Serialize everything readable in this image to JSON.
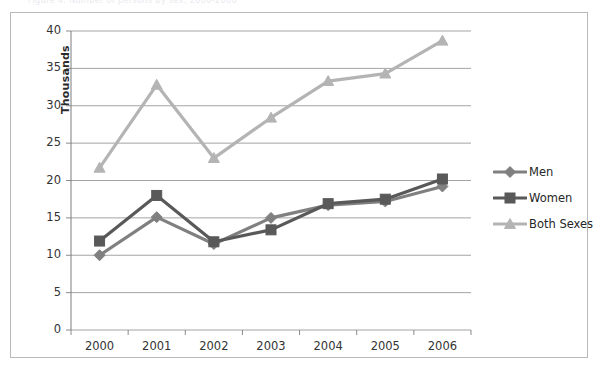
{
  "top_caption_remnant": "Figure 4. Number of persons by sex, 2000-2006",
  "chart_frame": {
    "border_color": "#b9b9b9",
    "background": "#ffffff"
  },
  "axis": {
    "y_title": "Thousands",
    "y_ticks": [
      "40",
      "35",
      "30",
      "25",
      "20",
      "15",
      "10",
      "5",
      "0"
    ],
    "x_ticks": [
      "2000",
      "2001",
      "2002",
      "2003",
      "2004",
      "2005",
      "2006"
    ]
  },
  "legend": {
    "position": "right",
    "entries": [
      {
        "label": "Men",
        "color": "#808080",
        "marker": "diamond"
      },
      {
        "label": "Women",
        "color": "#595959",
        "marker": "square"
      },
      {
        "label": "Both Sexes",
        "color": "#b4b4b4",
        "marker": "triangle"
      }
    ]
  },
  "chart_data": {
    "type": "line",
    "title": "",
    "subtitle": "",
    "xlabel": "",
    "ylabel": "Thousands",
    "categories": [
      "2000",
      "2001",
      "2002",
      "2003",
      "2004",
      "2005",
      "2006"
    ],
    "ylim": [
      0,
      40
    ],
    "ytick_step": 5,
    "grid": true,
    "grid_axis": "y",
    "legend_position": "right",
    "series": [
      {
        "name": "Men",
        "color": "#808080",
        "marker": "diamond",
        "values": [
          10.0,
          15.1,
          11.5,
          15.0,
          16.7,
          17.2,
          19.2
        ]
      },
      {
        "name": "Women",
        "color": "#595959",
        "marker": "square",
        "values": [
          11.9,
          18.0,
          11.8,
          13.4,
          16.9,
          17.5,
          20.2
        ]
      },
      {
        "name": "Both Sexes",
        "color": "#b4b4b4",
        "marker": "triangle",
        "values": [
          21.7,
          32.8,
          23.0,
          28.4,
          33.3,
          34.3,
          38.7
        ]
      }
    ]
  },
  "plot_geometry": {
    "left": 60,
    "top": 18,
    "right": 460,
    "bottom": 317
  }
}
